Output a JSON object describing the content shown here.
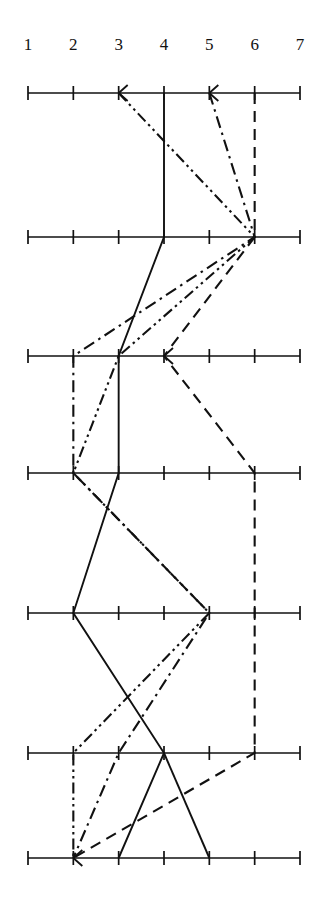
{
  "chart_data": {
    "type": "line",
    "title": "",
    "subtitle": "",
    "xlabel": "",
    "ylabel": "",
    "orientation": "parallel-coordinates-horizontal-axes",
    "axis_count": 7,
    "categories": [
      "1",
      "2",
      "3",
      "4",
      "5",
      "6",
      "7"
    ],
    "tick_labels": [
      "1",
      "2",
      "3",
      "4",
      "5",
      "6",
      "7"
    ],
    "xlim": [
      1,
      7
    ],
    "x_ticks": [
      1,
      2,
      3,
      4,
      5,
      6,
      7
    ],
    "grid": false,
    "legend": "none",
    "legend_position": "none",
    "rows": [
      "row-1",
      "row-2",
      "row-3",
      "row-4",
      "row-5",
      "row-6",
      "row-7"
    ],
    "series": [
      {
        "name": "series-solid",
        "style": "solid",
        "color": "#111111",
        "values": [
          4,
          4,
          3,
          3,
          2,
          4,
          3
        ]
      },
      {
        "name": "series-dashed",
        "style": "dashed",
        "color": "#111111",
        "values": [
          6,
          6,
          4,
          6,
          6,
          6,
          2
        ]
      },
      {
        "name": "series-dashdot",
        "style": "dash-dot",
        "color": "#111111",
        "values": [
          5,
          6,
          2,
          2,
          5,
          3,
          2
        ]
      },
      {
        "name": "series-dashdotdot",
        "style": "dash-dot-dot",
        "color": "#111111",
        "values": [
          3,
          6,
          3,
          2,
          5,
          2,
          2
        ]
      },
      {
        "name": "series-solid-branch",
        "style": "solid",
        "color": "#111111",
        "values": [
          null,
          null,
          null,
          null,
          null,
          4,
          5
        ]
      }
    ],
    "arrow_markers": [
      {
        "row": 1,
        "x": 3
      },
      {
        "row": 1,
        "x": 5
      },
      {
        "row": 3,
        "x": 4
      },
      {
        "row": 7,
        "x": 2
      }
    ]
  },
  "axis": {
    "line_color": "#111111",
    "tick_color": "#111111",
    "label_color": "#111111"
  }
}
